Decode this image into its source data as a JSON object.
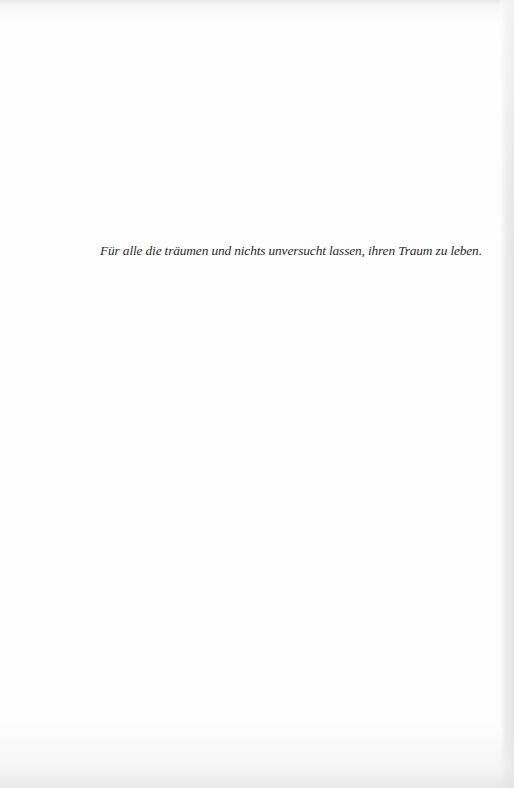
{
  "page": {
    "type": "dedication",
    "dedication_text": "Für alle die träumen und nichts unversucht lassen, ihren Traum zu leben."
  },
  "colors": {
    "paper": "#fefefe",
    "text": "#2a2a2a",
    "scan_edge": "#e2e2e2"
  }
}
